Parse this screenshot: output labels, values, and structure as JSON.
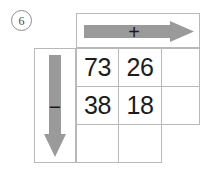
{
  "worksheet": {
    "problem_number": "6",
    "column_operation": {
      "symbol": "+",
      "icon": "arrow-right-icon",
      "color": "#9a9a9a"
    },
    "row_operation": {
      "symbol": "−",
      "icon": "arrow-down-icon",
      "color": "#9a9a9a"
    },
    "grid": {
      "columns": 3,
      "rows": 3,
      "cells": [
        [
          "73",
          "26",
          ""
        ],
        [
          "38",
          "18",
          ""
        ],
        [
          "",
          "",
          ""
        ]
      ]
    },
    "colors": {
      "grid_line": "#b9b9b9",
      "arrow_fill": "#9a9a9a",
      "text": "#1c1c1c",
      "background": "#ffffff"
    }
  }
}
